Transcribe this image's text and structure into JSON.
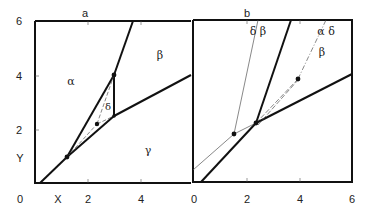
{
  "figure": {
    "panels": [
      {
        "id": "a",
        "label": "a",
        "y_ticks": [
          "6",
          "4",
          "2"
        ],
        "y_axis_label": "Y",
        "x_ticks": [
          "0",
          "2",
          "4"
        ],
        "x_axis_label": "X",
        "phase_labels": {
          "alpha": "α",
          "beta": "β",
          "gamma": "γ",
          "delta": "δ"
        }
      },
      {
        "id": "b",
        "label": "b",
        "x_ticks": [
          "0",
          "2",
          "4",
          "6"
        ],
        "phase_labels": {
          "delta_beta": "δ β",
          "alpha_delta": "α δ",
          "beta": "β"
        }
      }
    ]
  }
}
